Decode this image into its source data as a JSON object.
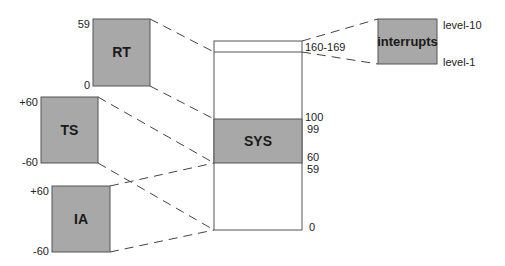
{
  "diagram": {
    "colors": {
      "box_fill": "#a8a8a8",
      "box_stroke": "#555555",
      "column_fill": "#ffffff",
      "line": "#444444"
    },
    "classes": [
      {
        "id": "rt",
        "label": "RT",
        "top_tick": "59",
        "bottom_tick": "0"
      },
      {
        "id": "ts",
        "label": "TS",
        "top_tick": "+60",
        "bottom_tick": "-60"
      },
      {
        "id": "ia",
        "label": "IA",
        "top_tick": "+60",
        "bottom_tick": "-60"
      },
      {
        "id": "interrupts",
        "label": "interrupts",
        "top_tick": "level-10",
        "bottom_tick": "level-1"
      }
    ],
    "global_column": {
      "bands": [
        {
          "id": "interrupt-band",
          "label": "160-169"
        },
        {
          "id": "sys-band",
          "label": "SYS",
          "top_tick": "100",
          "top_tick2": "99",
          "bottom_tick": "60",
          "bottom_tick2": "59"
        }
      ],
      "bottom_tick": "0"
    }
  }
}
